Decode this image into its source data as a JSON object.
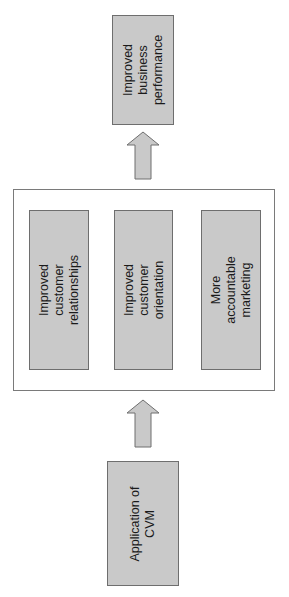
{
  "diagram": {
    "type": "flow",
    "direction": "bottom-to-top",
    "colors": {
      "box_fill": "#c9c9c9",
      "box_border": "#6e6e6e",
      "arrow_fill": "#c9c9c9",
      "container_border": "#7a7a7a"
    },
    "nodes": {
      "top": {
        "label": "Improved\nbusiness\nperformance"
      },
      "middle_group": {
        "items": [
          {
            "label": "Improved\ncustomer\nrelationships"
          },
          {
            "label": "Improved\ncustomer\norientation"
          },
          {
            "label": "More\naccountable\nmarketing"
          }
        ]
      },
      "bottom": {
        "label": "Application of\nCVM"
      }
    },
    "edges": [
      {
        "from": "bottom",
        "to": "middle_group"
      },
      {
        "from": "middle_group",
        "to": "top"
      }
    ]
  }
}
